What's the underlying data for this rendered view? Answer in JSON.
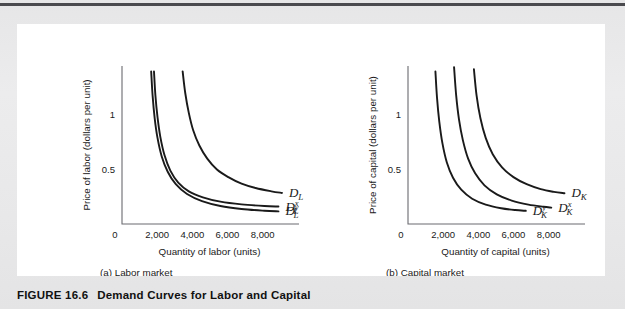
{
  "figure": {
    "caption_number": "FIGURE 16.6",
    "caption_text": "Demand Curves for Labor and Capital"
  },
  "chart_data": [
    {
      "type": "line",
      "panel_id": "a",
      "subcaption": "(a) Labor market",
      "title": "",
      "xlabel": "Quantity of labor (units)",
      "ylabel": "Price of labor (dollars per unit)",
      "origin_label": "0",
      "xticks": [
        "2,000",
        "4,000",
        "6,000",
        "8,000"
      ],
      "xtick_values": [
        2000,
        4000,
        6000,
        8000
      ],
      "yticks": [
        "0.5",
        "1"
      ],
      "ytick_values": [
        0.5,
        1
      ],
      "xlim": [
        0,
        9500
      ],
      "ylim": [
        0,
        1.45
      ],
      "grid": false,
      "legend": "inline-curve-labels",
      "series": [
        {
          "name": "D_L",
          "label_base": "D",
          "label_sub": "L",
          "label_sup": "",
          "points": [
            [
              3450,
              1.4
            ],
            [
              3600,
              1.2
            ],
            [
              3800,
              1.02
            ],
            [
              4050,
              0.86
            ],
            [
              4400,
              0.72
            ],
            [
              4850,
              0.6
            ],
            [
              5400,
              0.5
            ],
            [
              6050,
              0.43
            ],
            [
              6800,
              0.37
            ],
            [
              7600,
              0.33
            ],
            [
              8500,
              0.3
            ],
            [
              9100,
              0.285
            ]
          ]
        },
        {
          "name": "D_L^x",
          "label_base": "D",
          "label_sub": "L",
          "label_sup": "x",
          "points": [
            [
              1820,
              1.4
            ],
            [
              1900,
              1.18
            ],
            [
              2020,
              0.98
            ],
            [
              2180,
              0.8
            ],
            [
              2420,
              0.63
            ],
            [
              2750,
              0.49
            ],
            [
              3200,
              0.38
            ],
            [
              3800,
              0.3
            ],
            [
              4600,
              0.245
            ],
            [
              5600,
              0.205
            ],
            [
              6800,
              0.18
            ],
            [
              8100,
              0.165
            ],
            [
              8900,
              0.16
            ]
          ]
        },
        {
          "name": "D_L^y",
          "label_base": "D",
          "label_sub": "L",
          "label_sup": "y",
          "points": [
            [
              1660,
              1.4
            ],
            [
              1740,
              1.18
            ],
            [
              1860,
              0.97
            ],
            [
              2020,
              0.79
            ],
            [
              2260,
              0.62
            ],
            [
              2600,
              0.48
            ],
            [
              3060,
              0.365
            ],
            [
              3700,
              0.275
            ],
            [
              4550,
              0.21
            ],
            [
              5600,
              0.165
            ],
            [
              6800,
              0.138
            ],
            [
              8100,
              0.122
            ],
            [
              8900,
              0.116
            ]
          ]
        }
      ]
    },
    {
      "type": "line",
      "panel_id": "b",
      "subcaption": "(b) Capital market",
      "title": "",
      "xlabel": "Quantity of capital (units)",
      "ylabel": "Price of capital (dollars per unit)",
      "origin_label": "0",
      "xticks": [
        "2,000",
        "4,000",
        "6,000",
        "8,000"
      ],
      "xtick_values": [
        2000,
        4000,
        6000,
        8000
      ],
      "yticks": [
        "0.5",
        "1"
      ],
      "ytick_values": [
        0.5,
        1
      ],
      "xlim": [
        0,
        9500
      ],
      "ylim": [
        0,
        1.45
      ],
      "grid": false,
      "legend": "inline-curve-labels",
      "series": [
        {
          "name": "D_K",
          "label_base": "D",
          "label_sub": "K",
          "label_sup": "",
          "points": [
            [
              3750,
              1.42
            ],
            [
              3900,
              1.18
            ],
            [
              4120,
              0.97
            ],
            [
              4420,
              0.79
            ],
            [
              4820,
              0.64
            ],
            [
              5350,
              0.52
            ],
            [
              6000,
              0.43
            ],
            [
              6750,
              0.365
            ],
            [
              7550,
              0.32
            ],
            [
              8300,
              0.295
            ],
            [
              8900,
              0.282
            ]
          ]
        },
        {
          "name": "D_K^x",
          "label_base": "D",
          "label_sub": "K",
          "label_sup": "x",
          "points": [
            [
              2620,
              1.44
            ],
            [
              2740,
              1.18
            ],
            [
              2900,
              0.96
            ],
            [
              3120,
              0.77
            ],
            [
              3420,
              0.6
            ],
            [
              3820,
              0.465
            ],
            [
              4350,
              0.355
            ],
            [
              5050,
              0.272
            ],
            [
              5900,
              0.215
            ],
            [
              6850,
              0.178
            ],
            [
              7700,
              0.158
            ],
            [
              8150,
              0.15
            ]
          ]
        },
        {
          "name": "D_K^y",
          "label_base": "D",
          "label_sub": "K",
          "label_sup": "y",
          "points": [
            [
              1560,
              1.4
            ],
            [
              1650,
              1.16
            ],
            [
              1780,
              0.94
            ],
            [
              1960,
              0.74
            ],
            [
              2210,
              0.565
            ],
            [
              2560,
              0.425
            ],
            [
              3030,
              0.315
            ],
            [
              3650,
              0.232
            ],
            [
              4420,
              0.178
            ],
            [
              5300,
              0.145
            ],
            [
              6100,
              0.128
            ],
            [
              6700,
              0.121
            ]
          ]
        }
      ]
    }
  ]
}
